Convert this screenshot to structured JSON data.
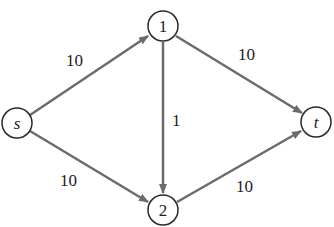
{
  "diagram": {
    "type": "flow-network",
    "nodes": [
      {
        "id": "s",
        "label": "s",
        "x": 17,
        "y": 123,
        "italic": true
      },
      {
        "id": "1",
        "label": "1",
        "x": 163,
        "y": 26,
        "italic": false
      },
      {
        "id": "2",
        "label": "2",
        "x": 163,
        "y": 210,
        "italic": false
      },
      {
        "id": "t",
        "label": "t",
        "x": 316,
        "y": 122,
        "italic": true
      }
    ],
    "edges": [
      {
        "from": "s",
        "to": "1",
        "capacity": "10",
        "label_x": 66,
        "label_y": 66
      },
      {
        "from": "s",
        "to": "2",
        "capacity": "10",
        "label_x": 60,
        "label_y": 186
      },
      {
        "from": "1",
        "to": "2",
        "capacity": "1",
        "label_x": 172,
        "label_y": 126
      },
      {
        "from": "1",
        "to": "t",
        "capacity": "10",
        "label_x": 238,
        "label_y": 60
      },
      {
        "from": "2",
        "to": "t",
        "capacity": "10",
        "label_x": 236,
        "label_y": 192
      }
    ],
    "colors": {
      "edge": "#6b6b6b",
      "node_stroke": "#2a2a2a",
      "text": "#222222"
    }
  }
}
